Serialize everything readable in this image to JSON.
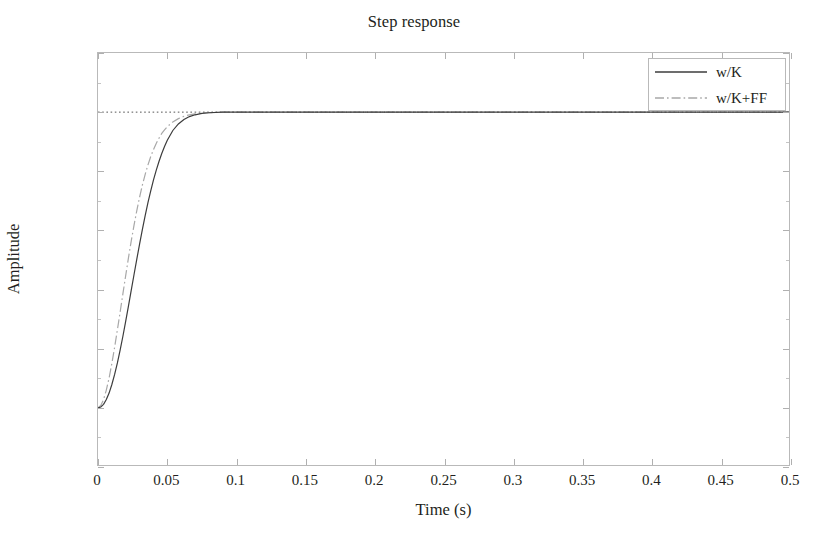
{
  "chart_data": {
    "type": "line",
    "title": "Step response",
    "xlabel": "Time (s)",
    "ylabel": "Amplitude",
    "xlim": [
      0,
      0.5
    ],
    "ylim": [
      -0.2,
      1.2
    ],
    "xticks": [
      0,
      0.05,
      0.1,
      0.15,
      0.2,
      0.25,
      0.3,
      0.35,
      0.4,
      0.45,
      0.5
    ],
    "xticklabels": [
      "0",
      "0.05",
      "0.1",
      "0.15",
      "0.2",
      "0.25",
      "0.3",
      "0.35",
      "0.4",
      "0.45",
      "0.5"
    ],
    "yticks": [
      -0.2,
      0,
      0.2,
      0.4,
      0.6,
      0.8,
      1,
      1.2
    ],
    "yticklabels": [
      "-0.2",
      "0",
      "0.2",
      "0.4",
      "0.6",
      "0.8",
      "1",
      "1.2"
    ],
    "grid": false,
    "legend_position": "upper right",
    "reference_line": {
      "y": 1,
      "style": "dotted",
      "color": "#555555"
    },
    "series": [
      {
        "name": "w/K",
        "style": "solid",
        "color": "#3c3c3c",
        "x": [
          0,
          0.002,
          0.004,
          0.006,
          0.008,
          0.01,
          0.012,
          0.014,
          0.016,
          0.018,
          0.02,
          0.022,
          0.024,
          0.026,
          0.028,
          0.03,
          0.032,
          0.034,
          0.036,
          0.038,
          0.04,
          0.042,
          0.044,
          0.046,
          0.048,
          0.05,
          0.054,
          0.058,
          0.062,
          0.066,
          0.07,
          0.075,
          0.08,
          0.09,
          0.1,
          0.12,
          0.15,
          0.2,
          0.3,
          0.4,
          0.5
        ],
        "y": [
          0.0,
          0.003,
          0.012,
          0.028,
          0.05,
          0.079,
          0.113,
          0.152,
          0.196,
          0.243,
          0.293,
          0.345,
          0.398,
          0.451,
          0.503,
          0.554,
          0.603,
          0.649,
          0.693,
          0.733,
          0.77,
          0.803,
          0.833,
          0.86,
          0.884,
          0.905,
          0.938,
          0.96,
          0.975,
          0.985,
          0.991,
          0.996,
          0.998,
          1.0,
          1.0,
          1.0,
          1.0,
          1.0,
          1.0,
          1.0,
          1.0
        ]
      },
      {
        "name": "w/K+FF",
        "style": "dash-dot",
        "color": "#a8a8a8",
        "x": [
          0,
          0.002,
          0.004,
          0.006,
          0.008,
          0.01,
          0.012,
          0.014,
          0.016,
          0.018,
          0.02,
          0.022,
          0.024,
          0.026,
          0.028,
          0.03,
          0.032,
          0.034,
          0.036,
          0.038,
          0.04,
          0.042,
          0.044,
          0.046,
          0.048,
          0.05,
          0.054,
          0.058,
          0.062,
          0.066,
          0.07,
          0.075,
          0.08,
          0.09,
          0.1,
          0.12,
          0.15,
          0.2,
          0.3,
          0.4,
          0.5
        ],
        "y": [
          0.0,
          0.008,
          0.028,
          0.06,
          0.101,
          0.15,
          0.205,
          0.264,
          0.325,
          0.387,
          0.448,
          0.508,
          0.565,
          0.618,
          0.667,
          0.712,
          0.753,
          0.789,
          0.821,
          0.849,
          0.873,
          0.894,
          0.912,
          0.928,
          0.94,
          0.951,
          0.967,
          0.978,
          0.986,
          0.991,
          0.994,
          0.997,
          0.998,
          1.0,
          1.0,
          1.0,
          1.0,
          1.0,
          1.0,
          1.0,
          1.0
        ]
      }
    ]
  }
}
